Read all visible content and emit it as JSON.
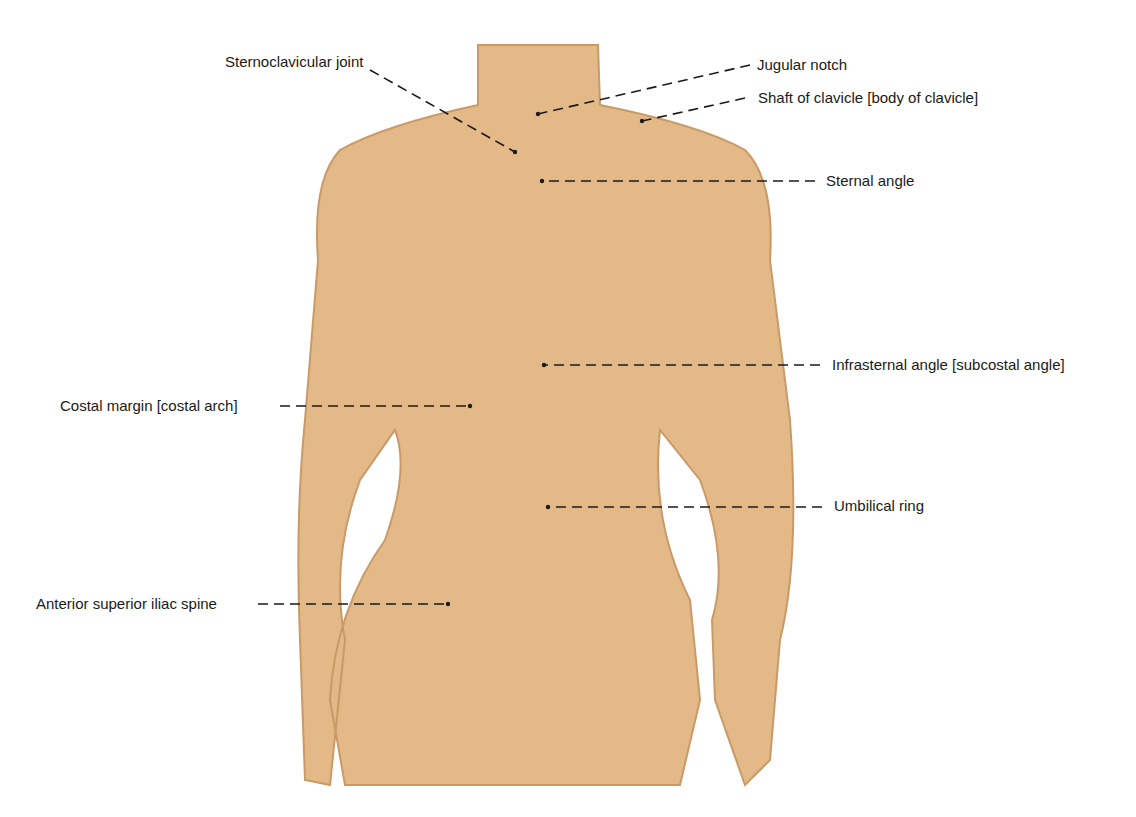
{
  "figure": {
    "skin_color": "#e2b987",
    "skin_shadow": "#c99a68",
    "line_color": "#1a1a1a"
  },
  "labels": [
    {
      "id": "sternoclavicular-joint",
      "text": "Sternoclavicular joint",
      "x": 225,
      "y": 53,
      "anchor": "left",
      "line": [
        [
          370,
          70
        ],
        [
          515,
          152
        ]
      ]
    },
    {
      "id": "jugular-notch",
      "text": "Jugular notch",
      "x": 757,
      "y": 56,
      "anchor": "left",
      "line": [
        [
          750,
          65
        ],
        [
          538,
          114
        ]
      ]
    },
    {
      "id": "shaft-of-clavicle",
      "text": "Shaft of clavicle [body of clavicle]",
      "x": 758,
      "y": 89,
      "anchor": "left",
      "line": [
        [
          745,
          98
        ],
        [
          642,
          121
        ]
      ]
    },
    {
      "id": "sternal-angle",
      "text": "Sternal angle",
      "x": 826,
      "y": 172,
      "anchor": "left",
      "line": [
        [
          815,
          181
        ],
        [
          542,
          181
        ]
      ]
    },
    {
      "id": "infrasternal-angle",
      "text": "Infrasternal angle [subcostal angle]",
      "x": 832,
      "y": 356,
      "anchor": "left",
      "line": [
        [
          820,
          365
        ],
        [
          544,
          365
        ]
      ]
    },
    {
      "id": "costal-margin",
      "text": "Costal margin [costal arch]",
      "x": 60,
      "y": 397,
      "anchor": "left",
      "line": [
        [
          280,
          406
        ],
        [
          470,
          406
        ]
      ]
    },
    {
      "id": "umbilical-ring",
      "text": "Umbilical ring",
      "x": 834,
      "y": 497,
      "anchor": "left",
      "line": [
        [
          822,
          507
        ],
        [
          548,
          507
        ]
      ]
    },
    {
      "id": "anterior-superior-iliac-spine",
      "text": "Anterior superior iliac spine",
      "x": 36,
      "y": 595,
      "anchor": "left",
      "line": [
        [
          258,
          604
        ],
        [
          448,
          604
        ]
      ]
    }
  ]
}
